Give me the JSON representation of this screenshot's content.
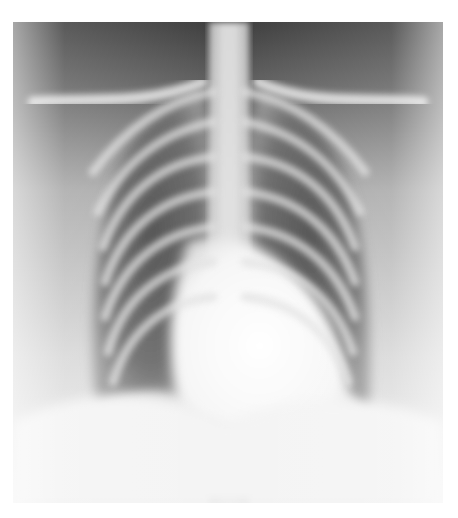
{
  "image": {
    "subject": "chest x-ray (PA view)",
    "description": "Grayscale frontal chest radiograph showing rib cage, clavicles, spine, both lung fields and cardiac silhouette",
    "colors": {
      "background": "#ffffff",
      "dark_tone": "#3a3a3a",
      "mid_tone": "#8a8a8a",
      "bone_tone": "#e6e6e6"
    }
  }
}
